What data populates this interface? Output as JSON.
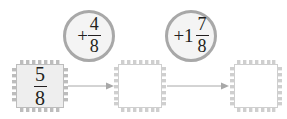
{
  "worksheet": {
    "type": "fraction-addition-flow-diagram",
    "colors": {
      "stamp_border": "#bdbdbd",
      "filled_box_fill": "#eeeeee",
      "empty_box_fill": "#ffffff",
      "circle_ring": "#a8a8a8",
      "circle_fill": "#f4f4f4",
      "arrow": "#a8a8a8",
      "text": "#231f20",
      "background": "#ffffff"
    },
    "boxes": [
      {
        "id": "start-value",
        "state": "filled",
        "numerator": "5",
        "denominator": "8",
        "whole": "",
        "answer_blank": false
      },
      {
        "id": "first-answer",
        "state": "empty",
        "numerator": "",
        "denominator": "",
        "whole": "",
        "answer_blank": true
      },
      {
        "id": "second-answer",
        "state": "empty",
        "numerator": "",
        "denominator": "",
        "whole": "",
        "answer_blank": true
      }
    ],
    "operations": [
      {
        "id": "operation-one",
        "sign": "+",
        "whole": "",
        "numerator": "4",
        "denominator": "8"
      },
      {
        "id": "operation-two",
        "sign": "+",
        "whole": "1",
        "numerator": "7",
        "denominator": "8"
      }
    ],
    "arrows": [
      {
        "id": "arrow-one",
        "direction": "right"
      },
      {
        "id": "arrow-two",
        "direction": "right"
      }
    ]
  }
}
